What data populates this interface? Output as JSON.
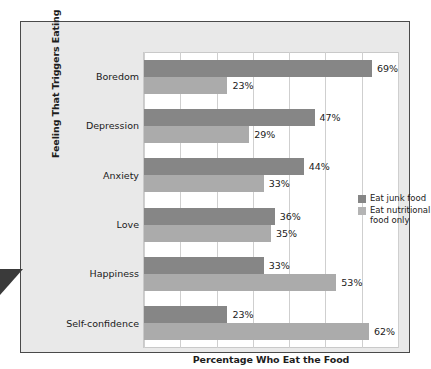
{
  "chart_data": {
    "type": "bar",
    "orientation": "horizontal",
    "title": "",
    "xlabel": "Percentage Who Eat the Food",
    "ylabel": "Feeling That Triggers Eating",
    "xlim": [
      0,
      70
    ],
    "grid": true,
    "gridline_values": [
      0,
      10,
      20,
      30,
      40,
      50,
      60,
      70
    ],
    "legend_position": "right",
    "categories": [
      "Boredom",
      "Depression",
      "Anxiety",
      "Love",
      "Happiness",
      "Self-confidence"
    ],
    "series": [
      {
        "name": "Eat junk food",
        "color": "#868686",
        "values": [
          69,
          47,
          44,
          36,
          33,
          23
        ],
        "labels": [
          "69%",
          "47%",
          "44%",
          "36%",
          "33%",
          "23%"
        ]
      },
      {
        "name": "Eat nutritional food only",
        "color": "#ababab",
        "values": [
          23,
          29,
          33,
          35,
          53,
          62
        ],
        "labels": [
          "23%",
          "29%",
          "33%",
          "35%",
          "53%",
          "62%"
        ]
      }
    ]
  },
  "axes": {
    "y_title": "Feeling That Triggers Eating",
    "x_title": "Percentage Who Eat the Food"
  },
  "categories": [
    {
      "label": "Boredom"
    },
    {
      "label": "Depression"
    },
    {
      "label": "Anxiety"
    },
    {
      "label": "Love"
    },
    {
      "label": "Happiness"
    },
    {
      "label": "Self-\nconfidence"
    }
  ],
  "legend": {
    "items": [
      {
        "label": "Eat junk food",
        "color": "#868686"
      },
      {
        "label": "Eat nutritional food only",
        "color": "#b4b4b4"
      }
    ]
  },
  "colors": {
    "junk_food": "#868686",
    "nutritional_food": "#ababab",
    "frame_background": "#e9e9e9",
    "frame_border": "#4a4a4a",
    "plot_background": "#ffffff",
    "gridline": "#cfcfcf",
    "pointer": "#3a3a3a"
  }
}
